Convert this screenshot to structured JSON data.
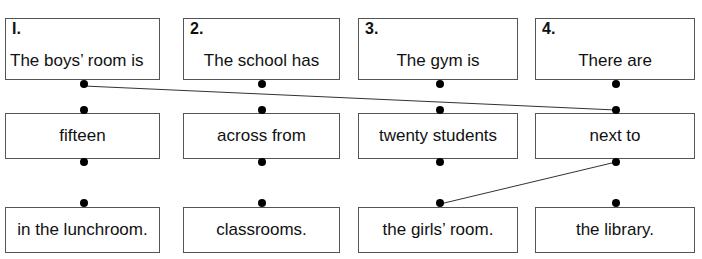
{
  "worksheet": {
    "title": "Sentence matching worksheet",
    "line_color": "#333333",
    "box_border_color": "#555555",
    "dot_color": "#000000",
    "background": "#ffffff"
  },
  "prompts": [
    {
      "number": "I.",
      "phrase": "The boys’ room is",
      "x": 5,
      "y": 18,
      "width": 155,
      "align": "left"
    },
    {
      "number": "2.",
      "phrase": "The school has",
      "x": 183,
      "y": 18,
      "width": 157,
      "align": "center"
    },
    {
      "number": "3.",
      "phrase": "The gym is",
      "x": 358,
      "y": 18,
      "width": 160,
      "align": "center"
    },
    {
      "number": "4.",
      "phrase": "There are",
      "x": 535,
      "y": 18,
      "width": 160,
      "align": "center"
    }
  ],
  "middle": [
    {
      "phrase": "fifteen",
      "x": 5,
      "y": 113,
      "width": 155
    },
    {
      "phrase": "across from",
      "x": 183,
      "y": 113,
      "width": 157
    },
    {
      "phrase": "twenty students",
      "x": 358,
      "y": 113,
      "width": 160
    },
    {
      "phrase": "next to",
      "x": 535,
      "y": 113,
      "width": 160
    }
  ],
  "bottom": [
    {
      "phrase": "in the lunchroom.",
      "x": 5,
      "y": 207,
      "width": 155
    },
    {
      "phrase": "classrooms.",
      "x": 183,
      "y": 207,
      "width": 157
    },
    {
      "phrase": "the girls’ room.",
      "x": 358,
      "y": 207,
      "width": 160
    },
    {
      "phrase": "the library.",
      "x": 535,
      "y": 207,
      "width": 160
    }
  ],
  "dots": [
    {
      "name": "dot-prompt-1-bottom",
      "x": 84,
      "y": 84
    },
    {
      "name": "dot-prompt-2-bottom",
      "x": 262,
      "y": 84
    },
    {
      "name": "dot-prompt-3-bottom",
      "x": 440,
      "y": 84
    },
    {
      "name": "dot-prompt-4-bottom",
      "x": 616,
      "y": 84
    },
    {
      "name": "dot-middle-1-top",
      "x": 84,
      "y": 110
    },
    {
      "name": "dot-middle-2-top",
      "x": 262,
      "y": 110
    },
    {
      "name": "dot-middle-3-top",
      "x": 440,
      "y": 110
    },
    {
      "name": "dot-middle-4-top",
      "x": 616,
      "y": 110
    },
    {
      "name": "dot-middle-1-bottom",
      "x": 84,
      "y": 162
    },
    {
      "name": "dot-middle-2-bottom",
      "x": 262,
      "y": 162
    },
    {
      "name": "dot-middle-3-bottom",
      "x": 440,
      "y": 162
    },
    {
      "name": "dot-middle-4-bottom",
      "x": 616,
      "y": 162
    },
    {
      "name": "dot-bottom-1-top",
      "x": 84,
      "y": 203
    },
    {
      "name": "dot-bottom-2-top",
      "x": 262,
      "y": 203
    },
    {
      "name": "dot-bottom-3-top",
      "x": 440,
      "y": 203
    },
    {
      "name": "dot-bottom-4-top",
      "x": 616,
      "y": 203
    }
  ],
  "connections": [
    {
      "name": "line-prompt1-to-nextto",
      "from": "dot-prompt-1-bottom",
      "to": "dot-middle-4-top",
      "x1": 84,
      "y1": 86,
      "x2": 616,
      "y2": 110
    },
    {
      "name": "line-nextto-to-girlsroom",
      "from": "dot-middle-4-bottom",
      "to": "dot-bottom-3-top",
      "x1": 616,
      "y1": 162,
      "x2": 440,
      "y2": 204
    }
  ]
}
